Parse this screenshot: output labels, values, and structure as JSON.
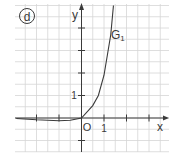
{
  "panel": {
    "label": "d"
  },
  "chart_data": {
    "type": "line",
    "title": "",
    "xlabel": "x",
    "ylabel": "y",
    "origin_label": "O",
    "x_tick_label": "1",
    "y_tick_label": "1",
    "xlim": [
      -3,
      4
    ],
    "ylim": [
      -1,
      5
    ],
    "grid": true,
    "grid_step": 0.5,
    "x_ticks": [
      -2,
      -1,
      1,
      2,
      3
    ],
    "y_ticks": [
      -1,
      1,
      2,
      3,
      4
    ],
    "series": [
      {
        "name": "G1",
        "label_main": "G",
        "label_sub": "1",
        "x": [
          -2.9,
          -2.0,
          -1.0,
          -0.5,
          0.0,
          0.5,
          0.75,
          1.0,
          1.15,
          1.3,
          1.42
        ],
        "y": [
          -0.02,
          -0.08,
          -0.12,
          -0.1,
          0.0,
          0.55,
          1.0,
          1.9,
          2.8,
          3.7,
          5.0
        ]
      }
    ]
  },
  "colors": {
    "ink": "#3a3a3a",
    "grid": "#d6d6d6",
    "background": "#ffffff"
  }
}
